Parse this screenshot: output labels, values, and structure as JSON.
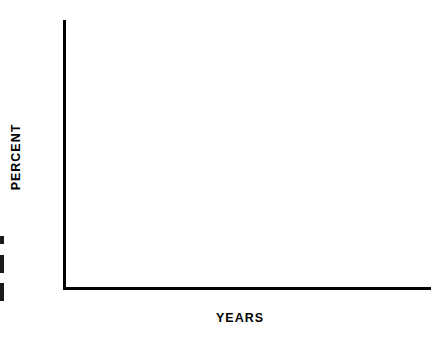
{
  "figure": {
    "axis_titles": {
      "y": "PERCENT",
      "x": "YEARS"
    },
    "y_ticks": [
      "100",
      "90",
      "80",
      "70",
      "60",
      "50",
      "40",
      "30",
      "20",
      "10"
    ],
    "x_ticks": [
      "1",
      "2",
      "3",
      "4",
      "5",
      "6"
    ]
  },
  "chart_data": {
    "type": "line",
    "title": "",
    "subtitle": "",
    "xlabel": "YEARS",
    "ylabel": "PERCENT",
    "xlim": [
      0,
      6
    ],
    "ylim": [
      0,
      100
    ],
    "xticks": [
      1,
      2,
      3,
      4,
      5,
      6
    ],
    "yticks": [
      10,
      20,
      30,
      40,
      50,
      60,
      70,
      80,
      90,
      100
    ],
    "x_minor_ticks": [
      0.5,
      1.5,
      2.5,
      3.5,
      4.5,
      5.5
    ],
    "grid": false,
    "legend": "inline-annotations",
    "curve_shape": "step-post (Kaplan-Meier survival)",
    "series": [
      {
        "name": "LOCAL",
        "label": "LOCAL (47)",
        "n": 47,
        "linestyle": "solid",
        "color": "#000000",
        "annotation": {
          "text": "LOCAL (47)",
          "x": 1.62,
          "y": 80,
          "arrow": true
        },
        "points": [
          [
            0.0,
            100
          ],
          [
            0.3,
            100
          ],
          [
            0.3,
            96
          ],
          [
            0.52,
            96
          ],
          [
            0.52,
            91
          ],
          [
            0.72,
            91
          ],
          [
            0.72,
            87
          ],
          [
            0.9,
            87
          ],
          [
            0.9,
            83
          ],
          [
            1.1,
            83
          ],
          [
            1.1,
            81
          ],
          [
            1.6,
            81
          ],
          [
            1.6,
            76
          ],
          [
            1.78,
            76
          ],
          [
            1.78,
            72
          ],
          [
            1.95,
            72
          ],
          [
            1.95,
            67
          ],
          [
            2.14,
            67
          ],
          [
            2.14,
            62
          ],
          [
            2.32,
            62
          ],
          [
            2.32,
            57
          ],
          [
            2.5,
            57
          ],
          [
            2.5,
            50
          ],
          [
            2.86,
            50
          ],
          [
            2.86,
            46
          ],
          [
            3.1,
            46
          ],
          [
            3.1,
            43
          ],
          [
            3.4,
            43
          ],
          [
            3.4,
            38
          ],
          [
            3.9,
            38
          ],
          [
            3.9,
            34
          ],
          [
            4.1,
            34
          ],
          [
            4.1,
            32
          ],
          [
            4.3,
            32
          ],
          [
            4.3,
            29
          ],
          [
            4.6,
            29
          ],
          [
            4.6,
            25
          ],
          [
            6.0,
            25
          ]
        ]
      },
      {
        "name": "PULMONARY",
        "label": "PULMONARY (40)",
        "n": 40,
        "linestyle": "dotted",
        "color": "#000000",
        "annotation": {
          "text": "PULMONARY (40)",
          "x": 1.52,
          "y": 42,
          "arrow": true
        },
        "points": [
          [
            0.0,
            100
          ],
          [
            0.16,
            100
          ],
          [
            0.16,
            97
          ],
          [
            0.34,
            97
          ],
          [
            0.34,
            95
          ],
          [
            0.52,
            95
          ],
          [
            0.52,
            92
          ],
          [
            0.68,
            92
          ],
          [
            0.68,
            87
          ],
          [
            0.84,
            87
          ],
          [
            0.84,
            84
          ],
          [
            1.0,
            84
          ],
          [
            1.0,
            80
          ],
          [
            1.22,
            80
          ],
          [
            1.22,
            77
          ],
          [
            1.44,
            77
          ],
          [
            1.44,
            72
          ],
          [
            1.62,
            72
          ],
          [
            1.62,
            67
          ],
          [
            1.82,
            67
          ],
          [
            1.82,
            62
          ],
          [
            2.04,
            62
          ],
          [
            2.04,
            57
          ],
          [
            2.28,
            57
          ],
          [
            2.28,
            54
          ],
          [
            2.6,
            54
          ],
          [
            2.6,
            50
          ],
          [
            2.96,
            50
          ],
          [
            2.96,
            46
          ],
          [
            3.22,
            46
          ],
          [
            3.22,
            42
          ],
          [
            3.46,
            42
          ],
          [
            3.46,
            38
          ],
          [
            3.72,
            38
          ],
          [
            3.72,
            33
          ],
          [
            4.18,
            33
          ],
          [
            4.18,
            29
          ],
          [
            4.54,
            29
          ],
          [
            4.54,
            25
          ],
          [
            4.8,
            25
          ],
          [
            4.8,
            21
          ],
          [
            5.2,
            21
          ],
          [
            5.2,
            19
          ],
          [
            6.0,
            19
          ]
        ]
      },
      {
        "name": "REGIONAL",
        "label": "REGIONAL (34)",
        "n": 34,
        "linestyle": "dashed-short",
        "color": "#000000",
        "annotation": {
          "text": "REGIONAL",
          "text2": "(34)",
          "x": 2.63,
          "y": 31,
          "arrow": true
        },
        "points": [
          [
            0.0,
            100
          ],
          [
            0.14,
            100
          ],
          [
            0.14,
            97
          ],
          [
            0.44,
            97
          ],
          [
            0.44,
            94
          ],
          [
            0.62,
            94
          ],
          [
            0.62,
            91
          ],
          [
            0.8,
            91
          ],
          [
            0.8,
            85
          ],
          [
            1.2,
            85
          ],
          [
            1.2,
            81
          ],
          [
            1.38,
            81
          ],
          [
            1.38,
            75
          ],
          [
            1.56,
            75
          ],
          [
            1.56,
            70
          ],
          [
            1.8,
            70
          ],
          [
            1.8,
            65
          ],
          [
            2.02,
            65
          ],
          [
            2.02,
            60
          ],
          [
            2.22,
            60
          ],
          [
            2.22,
            54
          ],
          [
            2.36,
            54
          ],
          [
            2.36,
            50
          ],
          [
            2.8,
            50
          ],
          [
            2.8,
            43
          ],
          [
            3.3,
            43
          ],
          [
            3.3,
            39
          ],
          [
            3.48,
            39
          ],
          [
            3.48,
            35
          ],
          [
            3.62,
            35
          ],
          [
            3.62,
            30
          ],
          [
            3.8,
            30
          ],
          [
            3.8,
            24
          ],
          [
            4.26,
            24
          ],
          [
            4.26,
            21
          ],
          [
            4.5,
            21
          ],
          [
            4.5,
            18
          ],
          [
            4.66,
            18
          ],
          [
            4.66,
            13
          ],
          [
            5.0,
            13
          ],
          [
            5.0,
            8
          ],
          [
            6.0,
            8
          ]
        ]
      },
      {
        "name": "VISCERAL",
        "label": "VISCERAL (13)",
        "n": 13,
        "linestyle": "dashed-long",
        "color": "#000000",
        "annotation": {
          "text": "VISCERAL (13)",
          "x": 0.4,
          "y": 20,
          "arrow": true
        },
        "points": [
          [
            0.0,
            100
          ],
          [
            0.06,
            100
          ],
          [
            0.06,
            87
          ],
          [
            0.16,
            87
          ],
          [
            0.16,
            77
          ],
          [
            0.22,
            77
          ],
          [
            0.22,
            69
          ],
          [
            0.3,
            69
          ],
          [
            0.3,
            62
          ],
          [
            0.54,
            62
          ],
          [
            0.54,
            39
          ],
          [
            0.8,
            39
          ],
          [
            0.8,
            31
          ],
          [
            1.02,
            31
          ],
          [
            1.02,
            24
          ],
          [
            1.5,
            24
          ],
          [
            1.5,
            15
          ],
          [
            1.72,
            15
          ],
          [
            1.72,
            9
          ],
          [
            2.1,
            9
          ],
          [
            2.1,
            7
          ],
          [
            2.16,
            7
          ]
        ]
      },
      {
        "name": "MULTIPLE",
        "label": "MULTIPLE (43)",
        "n": 43,
        "linestyle": "dash-dot",
        "color": "#000000",
        "annotation": {
          "text": "MULTIPLE (43)",
          "x": 2.55,
          "y": 18,
          "arrow": true
        },
        "points": [
          [
            0.0,
            100
          ],
          [
            0.1,
            100
          ],
          [
            0.1,
            91
          ],
          [
            0.18,
            91
          ],
          [
            0.18,
            86
          ],
          [
            0.44,
            86
          ],
          [
            0.44,
            82
          ],
          [
            0.6,
            82
          ],
          [
            0.6,
            78
          ],
          [
            0.9,
            78
          ],
          [
            0.9,
            69
          ],
          [
            1.06,
            69
          ],
          [
            1.06,
            63
          ],
          [
            1.24,
            63
          ],
          [
            1.24,
            57
          ],
          [
            1.42,
            57
          ],
          [
            1.42,
            53
          ],
          [
            1.6,
            53
          ],
          [
            1.6,
            49
          ],
          [
            1.8,
            49
          ],
          [
            1.8,
            44
          ],
          [
            2.04,
            44
          ],
          [
            2.04,
            40
          ],
          [
            2.34,
            40
          ],
          [
            2.34,
            37
          ],
          [
            2.6,
            37
          ],
          [
            2.6,
            35
          ],
          [
            2.9,
            35
          ],
          [
            2.9,
            33
          ],
          [
            3.3,
            33
          ],
          [
            3.3,
            27
          ],
          [
            3.48,
            27
          ],
          [
            3.48,
            23
          ],
          [
            3.96,
            23
          ],
          [
            3.96,
            21
          ],
          [
            4.4,
            21
          ],
          [
            4.4,
            20
          ],
          [
            4.66,
            20
          ],
          [
            4.66,
            15
          ],
          [
            5.24,
            15
          ],
          [
            5.24,
            14
          ],
          [
            6.0,
            14
          ]
        ]
      },
      {
        "name": "BONE",
        "label": "BONE (71)",
        "n": 71,
        "linestyle": "dotted-fine",
        "color": "#000000",
        "annotation": {
          "text": "BONE (71)",
          "x": 5.3,
          "y": 23,
          "arrow": true
        },
        "points": [
          [
            0.0,
            100
          ],
          [
            0.12,
            100
          ],
          [
            0.12,
            95
          ],
          [
            0.3,
            95
          ],
          [
            0.3,
            90
          ],
          [
            0.4,
            90
          ],
          [
            0.4,
            87
          ],
          [
            0.56,
            87
          ],
          [
            0.56,
            83
          ],
          [
            0.76,
            83
          ],
          [
            0.76,
            80
          ],
          [
            0.98,
            80
          ],
          [
            0.98,
            73
          ],
          [
            1.22,
            73
          ],
          [
            1.22,
            67
          ],
          [
            1.46,
            67
          ],
          [
            1.46,
            63
          ],
          [
            1.76,
            63
          ],
          [
            1.76,
            58
          ],
          [
            2.0,
            58
          ],
          [
            2.0,
            53
          ],
          [
            2.28,
            53
          ],
          [
            2.28,
            49
          ],
          [
            2.64,
            49
          ],
          [
            2.64,
            44
          ],
          [
            2.94,
            44
          ],
          [
            2.94,
            38
          ],
          [
            3.2,
            38
          ],
          [
            3.2,
            34
          ],
          [
            3.46,
            34
          ],
          [
            3.46,
            31
          ],
          [
            3.82,
            31
          ],
          [
            3.82,
            27
          ],
          [
            4.1,
            27
          ],
          [
            4.1,
            24
          ],
          [
            4.48,
            24
          ],
          [
            4.48,
            21
          ],
          [
            4.8,
            21
          ],
          [
            4.8,
            19
          ],
          [
            5.3,
            19
          ],
          [
            5.3,
            17
          ],
          [
            6.0,
            17
          ]
        ]
      }
    ]
  }
}
